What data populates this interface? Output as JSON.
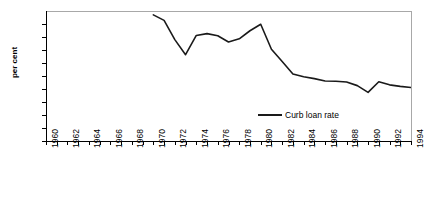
{
  "chart_data": {
    "type": "line",
    "title": "",
    "xlabel": "",
    "ylabel": "per cent",
    "xlim": [
      1960,
      1994
    ],
    "ylim": [
      0,
      50
    ],
    "ytick_step": 5,
    "yticks": [
      0,
      5,
      10,
      15,
      20,
      25,
      30,
      35,
      40,
      45,
      50
    ],
    "xticks": [
      1960,
      1962,
      1964,
      1966,
      1968,
      1970,
      1972,
      1974,
      1976,
      1978,
      1980,
      1982,
      1984,
      1986,
      1988,
      1990,
      1992,
      1994
    ],
    "grid": false,
    "legend_position": "inside-bottom-center",
    "series": [
      {
        "name": "Curb loan rate",
        "color": "#1a1a1a",
        "x": [
          1970,
          1971,
          1972,
          1973,
          1974,
          1975,
          1976,
          1977,
          1978,
          1979,
          1980,
          1981,
          1982,
          1983,
          1984,
          1985,
          1986,
          1987,
          1988,
          1989,
          1990,
          1991,
          1992,
          1993,
          1994
        ],
        "values": [
          48.5,
          46.4,
          39.0,
          33.2,
          40.6,
          41.3,
          40.5,
          38.1,
          39.3,
          42.4,
          44.9,
          35.3,
          30.6,
          25.8,
          24.7,
          24.0,
          23.1,
          23.0,
          22.7,
          21.3,
          18.7,
          22.8,
          21.6,
          21.0,
          20.6
        ]
      }
    ]
  }
}
